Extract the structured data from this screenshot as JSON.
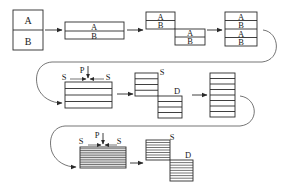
{
  "diagram": {
    "title": "",
    "type": "process-flow",
    "stages": [
      {
        "id": "stage-1",
        "layers": [
          "A",
          "B"
        ],
        "label_a": "A",
        "label_b": "B"
      },
      {
        "id": "stage-2",
        "layers": [
          "A",
          "B"
        ],
        "label_a": "A",
        "label_b": "B",
        "note": "flattened/rolled"
      },
      {
        "id": "stage-3",
        "top": {
          "layers": [
            "A",
            "B"
          ]
        },
        "bottom": {
          "layers": [
            "A",
            "B"
          ]
        },
        "note": "cut and offset"
      },
      {
        "id": "stage-4",
        "layers": [
          "A",
          "B",
          "A",
          "B"
        ],
        "note": "stacked"
      },
      {
        "id": "stage-5",
        "layer_count": 4,
        "pressure_label": "P",
        "shear_left_label": "S",
        "shear_right_label": "S"
      },
      {
        "id": "stage-6",
        "split_label": "S",
        "displacement_label": "D",
        "top_layers": 4,
        "bottom_layers": 4
      },
      {
        "id": "stage-7",
        "layer_count": 8
      },
      {
        "id": "stage-8",
        "layer_count": 12,
        "pressure_label": "P",
        "shear_left_label": "S",
        "shear_right_label": "S"
      },
      {
        "id": "stage-9",
        "split_label": "S",
        "displacement_label": "D",
        "top_layers": 8,
        "bottom_layers": 8
      }
    ],
    "labels": {
      "A": "A",
      "B": "B",
      "P": "P",
      "S": "S",
      "D": "D"
    },
    "colors": {
      "line": "#2a2a2a",
      "background": "#ffffff"
    }
  }
}
